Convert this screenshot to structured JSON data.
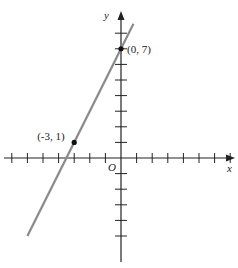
{
  "chart_data": {
    "type": "line",
    "title": "",
    "xlabel": "x",
    "ylabel": "y",
    "origin_label": "O",
    "xlim": [
      -7,
      8
    ],
    "ylim": [
      -7,
      8
    ],
    "grid": false,
    "tick_step": 1,
    "series": [
      {
        "name": "line through (-3, 1) and (0, 7)",
        "slope": 2,
        "intercept": 7,
        "x": [
          -6,
          0.8
        ],
        "y": [
          -5,
          8.6
        ],
        "color": "#808080"
      }
    ],
    "points": [
      {
        "x": -3,
        "y": 1,
        "label": "(-3, 1)"
      },
      {
        "x": 0,
        "y": 7,
        "label": "(0, 7)"
      }
    ]
  },
  "layout": {
    "origin_px": [
      121,
      158
    ],
    "unit_px": 15.6,
    "axis_color": "#222222",
    "line_color": "#8a8a8a"
  }
}
